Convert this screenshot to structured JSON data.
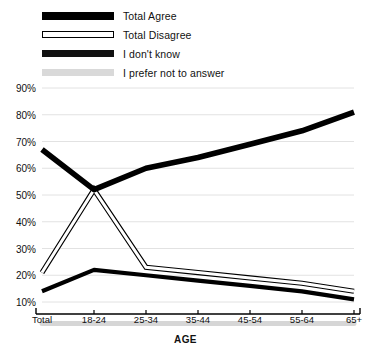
{
  "chart_data": {
    "type": "line",
    "title": "",
    "xlabel": "AGE",
    "ylabel": "",
    "categories": [
      "Total",
      "18-24",
      "25-34",
      "35-44",
      "45-54",
      "55-64",
      "65+"
    ],
    "ylim": [
      5,
      90
    ],
    "yticks": [
      10,
      20,
      30,
      40,
      50,
      60,
      70,
      80,
      90
    ],
    "ytick_labels": [
      "10%",
      "20%",
      "30%",
      "40%",
      "50%",
      "60%",
      "70%",
      "80%",
      "90%"
    ],
    "grid": true,
    "legend_position": "top-left",
    "series": [
      {
        "name": "Total Agree",
        "style": "thick-black",
        "color": "#000000",
        "values": [
          67,
          52,
          60,
          64,
          69,
          74,
          81
        ]
      },
      {
        "name": "Total Disagree",
        "style": "white-outline",
        "color": "#ffffff",
        "values": [
          21,
          52,
          23,
          21,
          19,
          17,
          14
        ]
      },
      {
        "name": "I don't know",
        "style": "medium-black",
        "color": "#000000",
        "values": [
          14,
          22,
          20,
          18,
          16,
          14,
          11
        ]
      },
      {
        "name": "I prefer not to answer",
        "style": "light-gray",
        "color": "#d9d9d9",
        "values": [
          2,
          2,
          2,
          2,
          2,
          2,
          2
        ]
      }
    ]
  },
  "legend": {
    "items": [
      {
        "label": "Total Agree",
        "swatch": "solid-black-bar"
      },
      {
        "label": "Total Disagree",
        "swatch": "outlined-white-bar"
      },
      {
        "label": "I don't know",
        "swatch": "solid-black-bar-thin"
      },
      {
        "label": "I prefer not to answer",
        "swatch": "light-gray-bar"
      }
    ]
  },
  "axes": {
    "x_title": "AGE",
    "x_categories": [
      "Total",
      "18-24",
      "25-34",
      "35-44",
      "45-54",
      "55-64",
      "65+"
    ],
    "y_tick_labels": [
      "90%",
      "80%",
      "70%",
      "60%",
      "50%",
      "40%",
      "30%",
      "20%",
      "10%"
    ]
  }
}
